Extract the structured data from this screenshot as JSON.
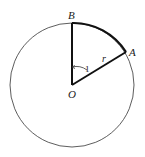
{
  "diagram": {
    "circle": {
      "cx": 72,
      "cy": 85,
      "r": 62
    },
    "points": {
      "O": {
        "label": "O",
        "x": 72,
        "y": 85
      },
      "A": {
        "label": "A",
        "x": 126,
        "y": 52
      },
      "B": {
        "label": "B",
        "x": 72,
        "y": 23
      }
    },
    "labels": {
      "radius": "r",
      "angle": "1",
      "O": "O",
      "A": "A",
      "B": "B"
    },
    "colors": {
      "stroke": "#111111",
      "thin_stroke": "#333333"
    }
  }
}
